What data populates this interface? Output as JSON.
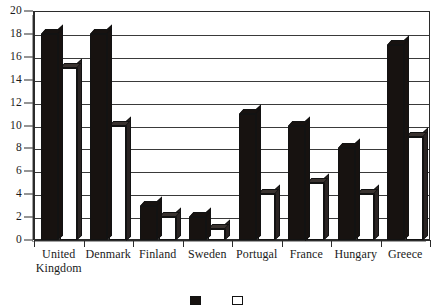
{
  "chart_data": {
    "type": "bar",
    "title": "",
    "xlabel": "",
    "ylabel": "",
    "ylim": [
      0,
      20
    ],
    "ytick_step": 2,
    "yticks": [
      0,
      2,
      4,
      6,
      8,
      10,
      12,
      14,
      16,
      18,
      20
    ],
    "grid": true,
    "legend_position": "bottom",
    "categories": [
      "United\nKingdom",
      "Denmark",
      "Finland",
      "Sweden",
      "Portugal",
      "France",
      "Hungary",
      "Greece"
    ],
    "series": [
      {
        "name": "",
        "color": "#171210",
        "style": "dark",
        "values": [
          18,
          18,
          3,
          2,
          11,
          10,
          8,
          17
        ]
      },
      {
        "name": "",
        "color": "#ffffff",
        "style": "light",
        "values": [
          15,
          10,
          2,
          1,
          4,
          5,
          4,
          9
        ]
      }
    ],
    "legend": [
      {
        "label": "",
        "style": "dark"
      },
      {
        "label": "",
        "style": "light"
      }
    ]
  },
  "axis": {
    "y_tick_labels": [
      "0",
      "2",
      "4",
      "6",
      "8",
      "10",
      "12",
      "14",
      "16",
      "18",
      "20"
    ]
  },
  "colors": {
    "bar_dark": "#171210",
    "bar_light": "#ffffff",
    "frame": "#2b2b2b",
    "gridline": "#3a3a3a",
    "background": "#ffffff"
  }
}
